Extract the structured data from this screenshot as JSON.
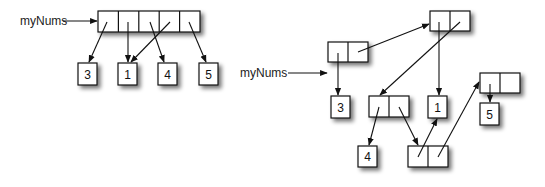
{
  "left_diagram": {
    "variable_label": "myNums",
    "description": "Array with 5 slots pointing to integer objects",
    "array_cells": 5,
    "values": [
      "3",
      "1",
      "4",
      "5"
    ],
    "pointers": [
      {
        "from_cell": 0,
        "to": "3"
      },
      {
        "from_cell": 1,
        "to": "1"
      },
      {
        "from_cell": 2,
        "to": "4"
      },
      {
        "from_cell": 3,
        "to": "1"
      },
      {
        "from_cell": 4,
        "to": "5"
      }
    ]
  },
  "right_diagram": {
    "variable_label": "myNums",
    "description": "Linked list of cons cells pointing to integer objects",
    "values": [
      "3",
      "1",
      "4",
      "5"
    ],
    "cons_cells": [
      "A",
      "B",
      "C",
      "D",
      "E"
    ],
    "pointers": [
      {
        "from": "myNums",
        "to": "A"
      },
      {
        "from": "A.car",
        "to": "3"
      },
      {
        "from": "A.cdr",
        "to": "B"
      },
      {
        "from": "B.car",
        "to": "1"
      },
      {
        "from": "B.cdr",
        "to": "C"
      },
      {
        "from": "C.car",
        "to": "4"
      },
      {
        "from": "C.cdr",
        "to": "E"
      },
      {
        "from": "E.car",
        "to": "1"
      },
      {
        "from": "E.cdr",
        "to": "D"
      },
      {
        "from": "D.car",
        "to": "5"
      }
    ]
  }
}
